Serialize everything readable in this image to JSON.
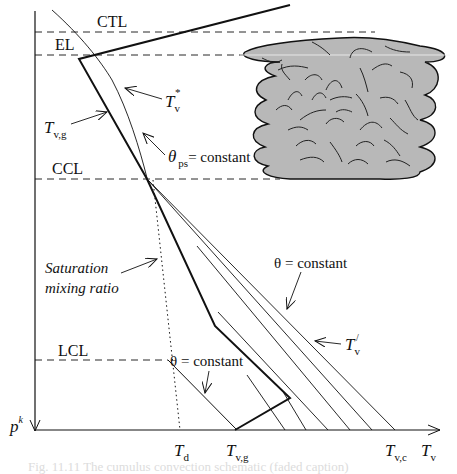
{
  "diagram": {
    "type": "thermodynamic-sounding-schematic",
    "colors": {
      "ink": "#111111",
      "cloud_fill": "#b8b8b8",
      "cloud_edge": "#111111",
      "caption": "#dcdcdc"
    },
    "levels": {
      "ctl": "CTL",
      "el": "EL",
      "ccl": "CCL",
      "lcl": "LCL"
    },
    "labels": {
      "tv_star_base": "T",
      "tv_star_sub": "v",
      "tv_star_sup": "*",
      "tvg_base": "T",
      "tvg_sub": "v,g",
      "theta_ps_base": "θ",
      "theta_ps_sub": "ps",
      "theta_ps_rest": "= constant",
      "saturation_line1": "Saturation",
      "saturation_line2": "mixing ratio",
      "theta_upper": "θ = constant",
      "tv_prime_base": "T",
      "tv_prime_sub": "v",
      "tv_prime_sup": "/",
      "theta_lower": "θ = constant"
    },
    "axes": {
      "y_label_base": "p",
      "y_label_sup": "k",
      "x_label_base": "T",
      "x_label_sub": "v",
      "x_ticks": [
        {
          "base": "T",
          "sub": "d"
        },
        {
          "base": "T",
          "sub": "v,g"
        },
        {
          "base": "T",
          "sub": "v,c"
        }
      ]
    },
    "caption": "Fig. 11.11  The cumulus convection schematic (faded caption)"
  }
}
